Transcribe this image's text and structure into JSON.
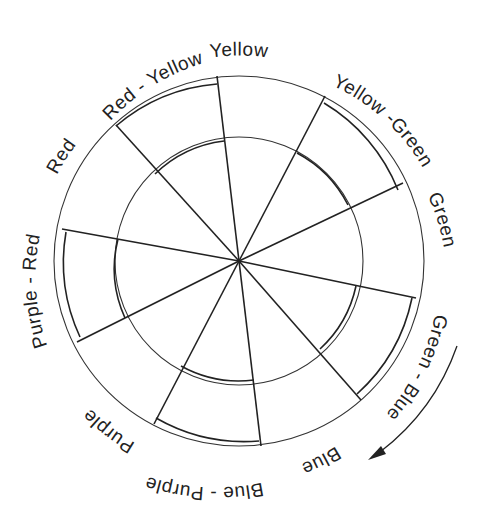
{
  "diagram": {
    "center": [
      239,
      261
    ],
    "outer_radius": 184,
    "inner_radius": 124,
    "segments": [
      {
        "name": "Yellow",
        "label": "Yellow",
        "start_deg": -96.5,
        "end_deg": -61,
        "type": "primary"
      },
      {
        "name": "Yellow-Green",
        "label": "Yellow -Green",
        "start_deg": -61,
        "end_deg": -25,
        "type": "intermediate"
      },
      {
        "name": "Green",
        "label": "Green",
        "start_deg": -25,
        "end_deg": 12,
        "type": "primary"
      },
      {
        "name": "Green-Blue",
        "label": "Green - Blue",
        "start_deg": 12,
        "end_deg": 49,
        "type": "intermediate"
      },
      {
        "name": "Blue",
        "label": "Blue",
        "start_deg": 49,
        "end_deg": 83,
        "type": "primary"
      },
      {
        "name": "Blue-Purple",
        "label": "Blue - Purple",
        "start_deg": 83,
        "end_deg": 120,
        "type": "intermediate"
      },
      {
        "name": "Purple",
        "label": "Purple",
        "start_deg": 120,
        "end_deg": 152,
        "type": "primary"
      },
      {
        "name": "Purple-Red",
        "label": "Purple - Red",
        "start_deg": 152,
        "end_deg": 190,
        "type": "intermediate"
      },
      {
        "name": "Red",
        "label": "Red",
        "start_deg": 190,
        "end_deg": 228,
        "type": "primary"
      },
      {
        "name": "Red-Yellow",
        "label": "Red - Yellow",
        "start_deg": 228,
        "end_deg": 263.5,
        "type": "intermediate"
      }
    ],
    "arrow": {
      "direction": "clockwise",
      "description": "curved arrow along right-lower rim"
    }
  }
}
